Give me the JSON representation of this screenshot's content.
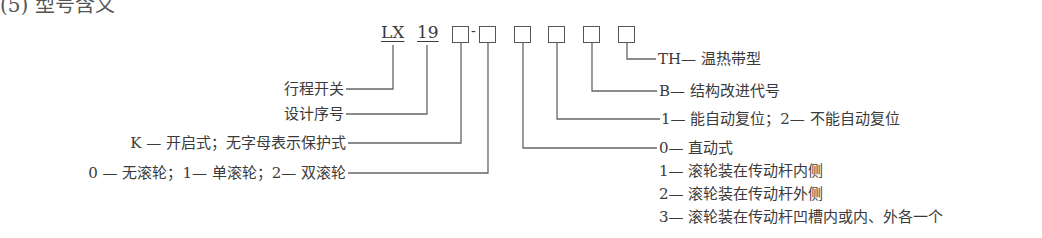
{
  "heading": "(5) 型号含义",
  "model_code": {
    "prefix": "LX",
    "series": "19",
    "dash": "-"
  },
  "left_labels": [
    "行程开关",
    "设计序号",
    "K — 开启式；无字母表示保护式",
    "0 — 无滚轮；1— 单滚轮；2— 双滚轮"
  ],
  "right_labels": [
    "TH— 温热带型",
    "B— 结构改进代号",
    "1— 能自动复位；2— 不能自动复位",
    "0— 直动式",
    "1— 滚轮装在传动杆内侧",
    "2— 滚轮装在传动杆外侧",
    "3— 滚轮装在传动杆凹槽内或内、外各一个"
  ]
}
